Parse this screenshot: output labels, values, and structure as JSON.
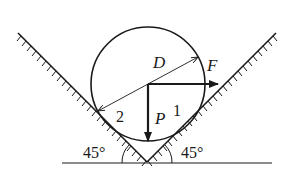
{
  "figure": {
    "type": "mechanics-free-body-diagram",
    "labels": {
      "diameter": "D",
      "horizontal_force": "F",
      "vertical_force": "P",
      "contact_right": "1",
      "contact_left": "2",
      "angle_left": "45°",
      "angle_right": "45°"
    },
    "colors": {
      "ink": "#1a1a1a",
      "background": "#ffffff"
    }
  }
}
